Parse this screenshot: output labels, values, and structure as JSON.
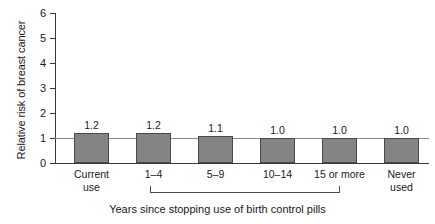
{
  "chart_data": {
    "type": "bar",
    "title": "",
    "xlabel": "Years since stopping use of birth control pills",
    "ylabel": "Relative risk of breast cancer",
    "categories": [
      "Current use",
      "1–4",
      "5–9",
      "10–14",
      "15 or more",
      "Never used"
    ],
    "category_lines": [
      [
        "Current",
        "use"
      ],
      [
        "1–4"
      ],
      [
        "5–9"
      ],
      [
        "10–14"
      ],
      [
        "15 or more"
      ],
      [
        "Never",
        "used"
      ]
    ],
    "values": [
      1.2,
      1.2,
      1.1,
      1.0,
      1.0,
      1.0
    ],
    "value_labels": [
      "1.2",
      "1.2",
      "1.1",
      "1.0",
      "1.0",
      "1.0"
    ],
    "ylim": [
      0,
      6
    ],
    "yticks": [
      0,
      1,
      2,
      3,
      4,
      5,
      6
    ],
    "ytick_labels": [
      "0",
      "1",
      "2",
      "3",
      "4",
      "5",
      "6"
    ],
    "grid": false,
    "legend": "none",
    "reference_line": 1.0,
    "bracket": {
      "label": "Years since stopping use of birth control pills",
      "spans_categories": [
        "1–4",
        "5–9",
        "10–14",
        "15 or more"
      ]
    },
    "colors": {
      "bar_fill": "#848484",
      "bar_edge": "#4a4a4a",
      "axis": "#3a3a3a",
      "reference_line": "#8a8a8a",
      "text": "#1a1a1a",
      "background": "#ffffff"
    }
  }
}
